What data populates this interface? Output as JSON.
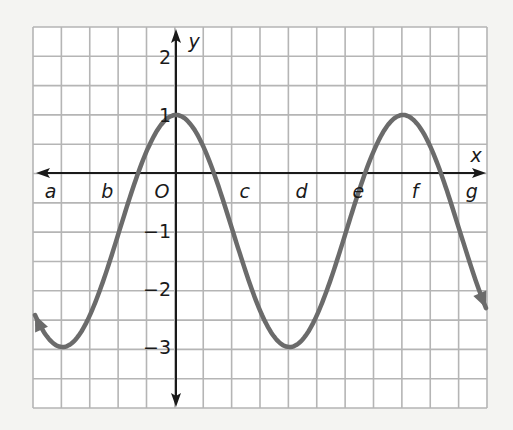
{
  "chart_data": {
    "type": "line",
    "title": "",
    "xlabel": "x",
    "ylabel": "y",
    "function_description": "cosine curve, max 1, min -3, midline -1, amplitude 2",
    "x_tick_labels": [
      "a",
      "b",
      "O",
      "c",
      "d",
      "e",
      "f",
      "g"
    ],
    "x_tick_positions_units": [
      -4,
      -2,
      0,
      2,
      4,
      6,
      8,
      10
    ],
    "y_tick_labels": [
      "2",
      "1",
      "-1",
      "-2",
      "-3"
    ],
    "y_ticks": [
      2,
      1,
      -1,
      -2,
      -3
    ],
    "grid": true,
    "grid_cols": 16,
    "grid_rows": 13,
    "xlim_units": [
      -5,
      11
    ],
    "ylim": [
      -4,
      2.5
    ],
    "period_units": 8,
    "series": [
      {
        "name": "curve",
        "key_points": [
          {
            "label": "a",
            "y": -3
          },
          {
            "label": "b",
            "y": -1
          },
          {
            "label": "O",
            "y": 1
          },
          {
            "label": "c",
            "y": -1
          },
          {
            "label": "d",
            "y": -3
          },
          {
            "label": "e",
            "y": -1
          },
          {
            "label": "f",
            "y": 1
          },
          {
            "label": "g",
            "y": -1
          }
        ],
        "arrows_both_ends": true
      }
    ],
    "colors": {
      "curve": "#6b6b6b",
      "grid": "#b5b5b5",
      "axis": "#1a1a1a",
      "background": "#ffffff"
    }
  },
  "axes": {
    "x_label": "x",
    "y_label": "y",
    "origin_label": "O"
  }
}
